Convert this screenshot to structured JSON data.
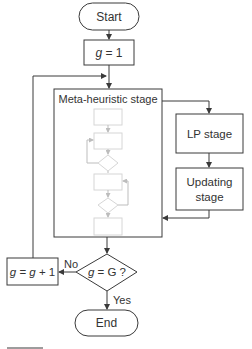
{
  "flowchart": {
    "start": "Start",
    "init": "g = 1",
    "init_var": "g",
    "init_rest": " = 1",
    "meta_stage": "Meta-heuristic stage",
    "lp_stage": "LP stage",
    "updating_stage_line1": "Updating",
    "updating_stage_line2": "stage",
    "decision": "g = G ?",
    "decision_parts": {
      "a": "g",
      "b": " = G ?"
    },
    "increment_parts": {
      "a": "g",
      "b": " = ",
      "c": "g",
      "d": " + 1"
    },
    "no_label": "No",
    "yes_label": "Yes",
    "end": "End"
  },
  "colors": {
    "stroke": "#3a3a3a",
    "faint": "#d6d6d6",
    "text": "#333333"
  }
}
